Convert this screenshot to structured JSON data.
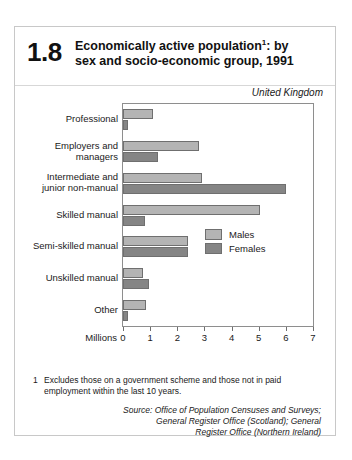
{
  "figure": {
    "number": "1.8",
    "title_line1": "Economically active population",
    "title_footnote_marker": "1",
    "title_line1_tail": ": by",
    "title_line2": "sex and socio-economic group, 1991",
    "region": "United Kingdom"
  },
  "footnote": {
    "marker": "1",
    "text": "Excludes those on a government scheme and those not in paid employment within the last 10 years."
  },
  "source": {
    "line1": "Source: Office of Population Censuses and Surveys;",
    "line2": "General Register Office (Scotland); General",
    "line3": "Register Office (Northern Ireland)"
  },
  "colors": {
    "males": "#b4b4b4",
    "females": "#858585",
    "bar_border": "#6f6f6f",
    "frame": "#c8c8c8",
    "axis": "#8e8e8e"
  },
  "chart_data": {
    "type": "bar",
    "orientation": "horizontal",
    "subtitle": "United Kingdom",
    "xlabel": "Millions",
    "ylabel": "",
    "xlim": [
      0,
      7
    ],
    "xticks": [
      0,
      1,
      2,
      3,
      4,
      5,
      6,
      7
    ],
    "xtick_labels": [
      "0",
      "1",
      "2",
      "3",
      "4",
      "5",
      "6",
      "7"
    ],
    "grid": false,
    "legend_position": "inside-right",
    "categories": [
      "Professional",
      "Employers and managers",
      "Intermediate and junior non-manual",
      "Skilled manual",
      "Semi-skilled manual",
      "Unskilled manual",
      "Other"
    ],
    "category_label_lines": [
      [
        "Professional"
      ],
      [
        "Employers and",
        "managers"
      ],
      [
        "Intermediate and",
        "junior non-manual"
      ],
      [
        "Skilled manual"
      ],
      [
        "Semi-skilled manual"
      ],
      [
        "Unskilled manual"
      ],
      [
        "Other"
      ]
    ],
    "series": [
      {
        "name": "Males",
        "color": "#b4b4b4",
        "values": [
          1.1,
          2.8,
          2.9,
          5.05,
          2.4,
          0.75,
          0.85
        ]
      },
      {
        "name": "Females",
        "color": "#858585",
        "values": [
          0.2,
          1.3,
          6.0,
          0.8,
          2.4,
          0.95,
          0.2
        ]
      }
    ]
  }
}
